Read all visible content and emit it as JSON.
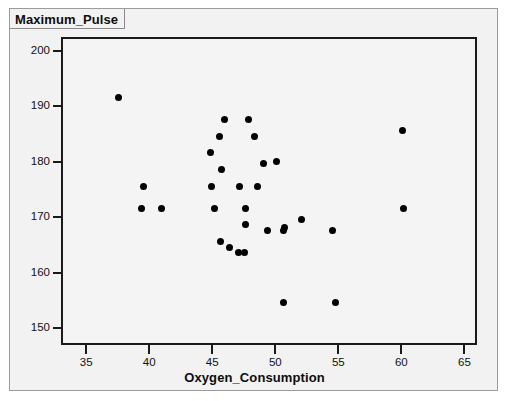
{
  "window": {
    "title_label": "Maximum_Pulse",
    "background_color": "#f2f2f2",
    "border_color": "#9b9b9b"
  },
  "chart_data": {
    "type": "scatter",
    "title": "Maximum_Pulse",
    "xlabel": "Oxygen_Consumption",
    "ylabel": "Maximum_Pulse",
    "xlim": [
      33.0,
      66.0
    ],
    "ylim": [
      147.0,
      202.5
    ],
    "xticks": [
      35,
      40,
      45,
      50,
      55,
      60,
      65
    ],
    "xtick_labels": [
      "35",
      "40",
      "45",
      "50",
      "55",
      "60",
      "65"
    ],
    "yticks": [
      150,
      160,
      170,
      180,
      190,
      200
    ],
    "ytick_labels": [
      "150",
      "160",
      "170",
      "180",
      "190",
      "200"
    ],
    "grid": false,
    "legend": false,
    "marker": "filled-circle",
    "marker_color": "#000000",
    "plot_background": "#f4f4f4",
    "axis_color": "#1a1a1a",
    "n_points": 31,
    "points": [
      {
        "x": 37.4,
        "y": 192.0
      },
      {
        "x": 39.4,
        "y": 176.0
      },
      {
        "x": 39.2,
        "y": 172.0
      },
      {
        "x": 40.8,
        "y": 172.0
      },
      {
        "x": 45.8,
        "y": 188.0
      },
      {
        "x": 45.4,
        "y": 185.0
      },
      {
        "x": 44.7,
        "y": 182.0
      },
      {
        "x": 45.6,
        "y": 179.0
      },
      {
        "x": 44.8,
        "y": 176.0
      },
      {
        "x": 45.0,
        "y": 172.0
      },
      {
        "x": 47.7,
        "y": 188.0
      },
      {
        "x": 48.2,
        "y": 185.0
      },
      {
        "x": 48.9,
        "y": 180.0
      },
      {
        "x": 47.0,
        "y": 176.0
      },
      {
        "x": 47.5,
        "y": 172.0
      },
      {
        "x": 47.5,
        "y": 169.0
      },
      {
        "x": 45.5,
        "y": 166.0
      },
      {
        "x": 46.2,
        "y": 165.0
      },
      {
        "x": 46.9,
        "y": 164.0
      },
      {
        "x": 47.4,
        "y": 164.0
      },
      {
        "x": 49.2,
        "y": 168.0
      },
      {
        "x": 50.5,
        "y": 168.0
      },
      {
        "x": 51.9,
        "y": 170.0
      },
      {
        "x": 50.6,
        "y": 168.5
      },
      {
        "x": 54.4,
        "y": 168.0
      },
      {
        "x": 50.5,
        "y": 155.0
      },
      {
        "x": 54.6,
        "y": 155.0
      },
      {
        "x": 59.9,
        "y": 186.0
      },
      {
        "x": 60.0,
        "y": 172.0
      },
      {
        "x": 49.9,
        "y": 180.5
      },
      {
        "x": 48.4,
        "y": 176.0
      }
    ]
  }
}
